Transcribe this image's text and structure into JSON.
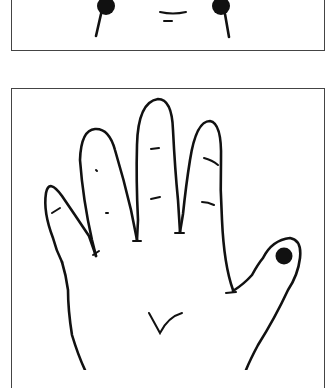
{
  "figure": {
    "type": "line-drawing illustration",
    "panels": [
      {
        "id": "top",
        "subject": "face (partially cropped)",
        "markers": [
          {
            "name": "left-point",
            "shape": "filled-circle"
          },
          {
            "name": "right-point",
            "shape": "filled-circle"
          }
        ]
      },
      {
        "id": "bottom",
        "subject": "open hand, palm view",
        "markers": [
          {
            "name": "thumb-tip-point",
            "shape": "filled-circle"
          }
        ]
      }
    ],
    "colors": {
      "ink": "#111111",
      "border": "#444444",
      "background": "#ffffff"
    }
  }
}
